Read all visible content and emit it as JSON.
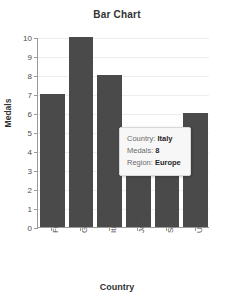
{
  "chart_data": {
    "type": "bar",
    "title": "Bar Chart",
    "xlabel": "Country",
    "ylabel": "Medals",
    "categories": [
      "France",
      "Germany",
      "Italy",
      "Japan",
      "Spain",
      "USA"
    ],
    "values": [
      7,
      10,
      8,
      3,
      3,
      6
    ],
    "ylim": [
      0,
      10
    ],
    "ytick_labels": [
      "0",
      "1",
      "2",
      "3",
      "4",
      "5",
      "6",
      "7",
      "8",
      "9",
      "10"
    ],
    "ytick_values": [
      0,
      1,
      2,
      3,
      4,
      5,
      6,
      7,
      8,
      9,
      10
    ],
    "grid": true,
    "legend": false,
    "bar_color": "#4a4a4a",
    "plot_background": "#ffffff",
    "gridline_color": "#ededed",
    "axis_color": "#9a9a9a",
    "xtick_rotation": -90
  },
  "tooltip": {
    "visible": true,
    "rows": [
      {
        "label": "Country:",
        "value": "Italy"
      },
      {
        "label": "Medals:",
        "value": "8"
      },
      {
        "label": "Region:",
        "value": "Europe"
      }
    ]
  }
}
